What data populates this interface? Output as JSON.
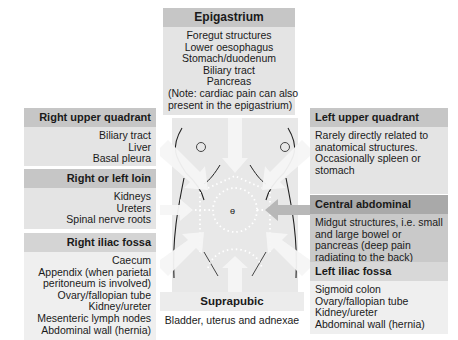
{
  "epigastrium": {
    "title": "Epigastrium",
    "lines": [
      "Foregut structures",
      "Lower oesophagus",
      "Stomach/duodenum",
      "Biliary tract",
      "Pancreas",
      "(Note: cardiac pain can also",
      "present in the epigastrium)"
    ]
  },
  "right_upper_quadrant": {
    "title": "Right upper quadrant",
    "lines": [
      "Biliary tract",
      "Liver",
      "Basal pleura"
    ]
  },
  "right_or_left_loin": {
    "title": "Right or left loin",
    "lines": [
      "Kidneys",
      "Ureters",
      "Spinal nerve roots"
    ]
  },
  "right_iliac_fossa": {
    "title": "Right iliac fossa",
    "lines": [
      "Caecum",
      "Appendix (when parietal",
      "peritoneum is involved)",
      "Ovary/fallopian tube",
      "Kidney/ureter",
      "Mesenteric lymph nodes",
      "Abdominal wall (hernia)"
    ]
  },
  "left_upper_quadrant": {
    "title": "Left upper quadrant",
    "lines": [
      "Rarely directly related to",
      "anatomical structures.",
      "Occasionally spleen or",
      "stomach"
    ]
  },
  "central_abdominal": {
    "title": "Central abdominal",
    "lines": [
      "Midgut structures, i.e. small",
      "and large bowel or",
      "pancreas (deep pain",
      "radiating to the back)"
    ]
  },
  "left_iliac_fossa": {
    "title": "Left iliac fossa",
    "lines": [
      "Sigmoid colon",
      "Ovary/fallopian tube",
      "Kidney/ureter",
      "Abdominal wall (hernia)"
    ]
  },
  "suprapubic": {
    "title": "Suprapubic",
    "lines": [
      "Bladder, uterus and adnexae"
    ]
  },
  "colors": {
    "header": "#c6c6c6",
    "body": "#e4e4e4",
    "central_header": "#a9a9a9",
    "central_body": "#c9c9c9",
    "torso": "#e6e6e6"
  }
}
